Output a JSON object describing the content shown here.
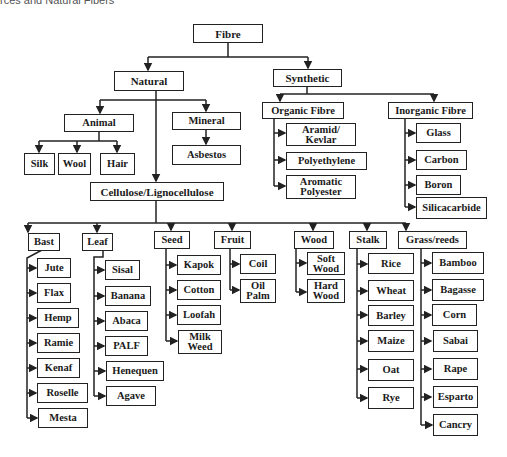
{
  "caption": "rces and Natural Fibers",
  "root": "Fibre",
  "natural": {
    "label": "Natural",
    "animal": {
      "label": "Animal",
      "children": [
        "Silk",
        "Wool",
        "Hair"
      ]
    },
    "mineral": {
      "label": "Mineral",
      "children": [
        "Asbestos"
      ]
    },
    "cellulose": {
      "label": "Cellulose/Lignocellulose",
      "groups": [
        {
          "label": "Bast",
          "children": [
            "Jute",
            "Flax",
            "Hemp",
            "Ramie",
            "Kenaf",
            "Roselle",
            "Mesta"
          ]
        },
        {
          "label": "Leaf",
          "children": [
            "Sisal",
            "Banana",
            "Abaca",
            "PALF",
            "Henequen",
            "Agave"
          ]
        },
        {
          "label": "Seed",
          "children": [
            "Kapok",
            "Cotton",
            "Loofah",
            "Milk\nWeed"
          ]
        },
        {
          "label": "Fruit",
          "children": [
            "Coil",
            "Oil\nPalm"
          ]
        },
        {
          "label": "Wood",
          "children": [
            "Soft\nWood",
            "Hard\nWood"
          ]
        },
        {
          "label": "Stalk",
          "children": [
            "Rice",
            "Wheat",
            "Barley",
            "Maize",
            "Oat",
            "Rye"
          ]
        },
        {
          "label": "Grass/reeds",
          "children": [
            "Bamboo",
            "Bagasse",
            "Corn",
            "Sabai",
            "Rape",
            "Esparto",
            "Cancry"
          ]
        }
      ]
    }
  },
  "synthetic": {
    "label": "Synthetic",
    "organic": {
      "label": "Organic Fibre",
      "children": [
        "Aramid/\nKevlar",
        "Polyethylene",
        "Aromatic\nPolyester"
      ]
    },
    "inorganic": {
      "label": "Inorganic Fibre",
      "children": [
        "Glass",
        "Carbon",
        "Boron",
        "Silicacarbide"
      ]
    }
  }
}
